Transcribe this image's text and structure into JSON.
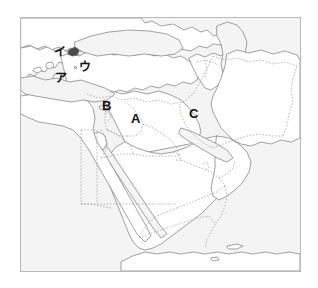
{
  "figure": {
    "frame": {
      "border_color": "#b9b9b9",
      "background": "#ffffff"
    }
  },
  "map": {
    "projection_note": "Middle East / Eastern Mediterranean region",
    "colors": {
      "land_fill": "#ffffff",
      "sea_fill": "#f4f4f4",
      "coastline": "#7a7a7a",
      "border_dashed": "#8a8a8a",
      "label_text": "#111111"
    },
    "labels": [
      {
        "id": "label-a",
        "text": "A",
        "kind": "latin",
        "x": 131,
        "y": 112
      },
      {
        "id": "label-b",
        "text": "B",
        "kind": "latin",
        "x": 102,
        "y": 99
      },
      {
        "id": "label-c",
        "text": "C",
        "kind": "latin",
        "x": 189,
        "y": 107
      },
      {
        "id": "label-a-kana",
        "text": "ア",
        "kind": "kana",
        "x": 55,
        "y": 72
      },
      {
        "id": "label-i-kana",
        "text": "イ",
        "kind": "kana",
        "x": 54,
        "y": 46
      },
      {
        "id": "label-u-kana",
        "text": "ウ",
        "kind": "kana",
        "x": 79,
        "y": 61
      }
    ],
    "markers": [
      {
        "id": "city-dot-ankara",
        "x": 74,
        "y": 66
      }
    ]
  }
}
